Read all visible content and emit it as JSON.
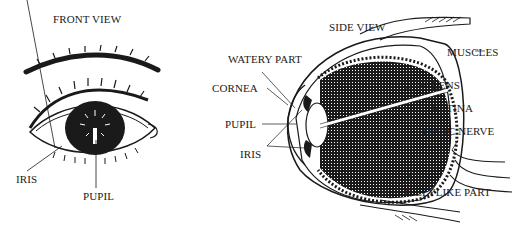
{
  "front_view": {
    "title": "FRONT VIEW",
    "labels": {
      "iris": "IRIS",
      "pupil": "PUPIL"
    }
  },
  "side_view": {
    "title": "SIDE VIEW",
    "labels": {
      "watery_part": "WATERY PART",
      "cornea": "CORNEA",
      "pupil": "PUPIL",
      "iris": "IRIS",
      "muscles": "MUSCLES",
      "lens": "LENS",
      "retina": "RETINA",
      "optic_nerve": "OPTIC NERVE",
      "jellylike_part": "JELLYLIKE PART"
    }
  },
  "colors": {
    "ink": "#1a1a1a",
    "background": "#ffffff"
  }
}
